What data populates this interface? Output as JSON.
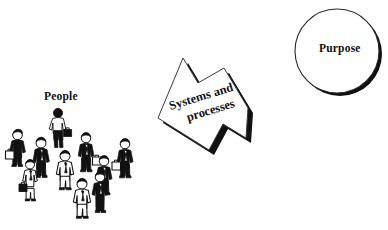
{
  "canvas": {
    "width": 388,
    "height": 230,
    "background": "#ffffff",
    "ink": "#111111"
  },
  "diagram": {
    "type": "concept-diagram",
    "elements": [
      {
        "name": "people",
        "label": "People",
        "shape": "crowd-clipart",
        "figure_count": 10
      },
      {
        "name": "systems-and-processes",
        "label_line_1": "Systems and",
        "label_line_2": "processes",
        "shape": "arrow-banner",
        "rotation_degrees": -16,
        "shadow": "#111111"
      },
      {
        "name": "purpose",
        "label": "Purpose",
        "shape": "circle",
        "shadow": "#111111"
      }
    ]
  },
  "labels": {
    "people": "People",
    "systems_line1": "Systems and",
    "systems_line2": "processes",
    "purpose": "Purpose"
  },
  "colors": {
    "ink": "#111111",
    "shadow": "#1a1a1a",
    "outline": "#3a3a3a",
    "fill": "#ffffff"
  }
}
